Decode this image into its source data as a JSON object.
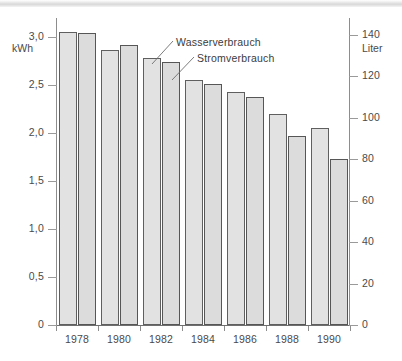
{
  "chart_data": {
    "type": "bar",
    "title": "",
    "subtitle": "",
    "categories": [
      "1978",
      "1980",
      "1982",
      "1984",
      "1986",
      "1988",
      "1990"
    ],
    "xlabel": "",
    "grid": false,
    "legend_position": "inline-annotations",
    "series": [
      {
        "name": "Stromverbrauch",
        "axis": "left",
        "unit": "kWh",
        "values": [
          3.05,
          2.87,
          2.78,
          2.55,
          2.43,
          2.2,
          2.05
        ]
      },
      {
        "name": "Wasserverbrauch",
        "axis": "right",
        "unit": "Liter",
        "values": [
          141,
          135,
          127,
          116,
          110,
          91,
          80
        ]
      }
    ],
    "axes": {
      "left": {
        "label": "kWh",
        "ylim": [
          0,
          3.2
        ],
        "ticks": [
          0,
          0.5,
          1.0,
          1.5,
          2.0,
          2.5,
          3.0
        ],
        "tick_labels": [
          "0",
          "0,5",
          "1,0",
          "1,5",
          "2,0",
          "2,5",
          "3,0"
        ]
      },
      "right": {
        "label": "Liter",
        "ylim": [
          0,
          148
        ],
        "ticks": [
          0,
          20,
          40,
          60,
          80,
          100,
          120,
          140
        ],
        "tick_labels": [
          "0",
          "20",
          "40",
          "60",
          "80",
          "100",
          "120",
          "140"
        ]
      }
    },
    "annotations": [
      {
        "text": "Wasserverbrauch",
        "points_to": "1982 water bar"
      },
      {
        "text": "Stromverbrauch",
        "points_to": "1984 power bar"
      }
    ],
    "colors": {
      "bar_fill": "#e2e2e2",
      "bar_stroke": "#5f5f5f",
      "axis": "#8d8d8d",
      "text": "#3c3c3c",
      "background": "#ffffff"
    }
  }
}
